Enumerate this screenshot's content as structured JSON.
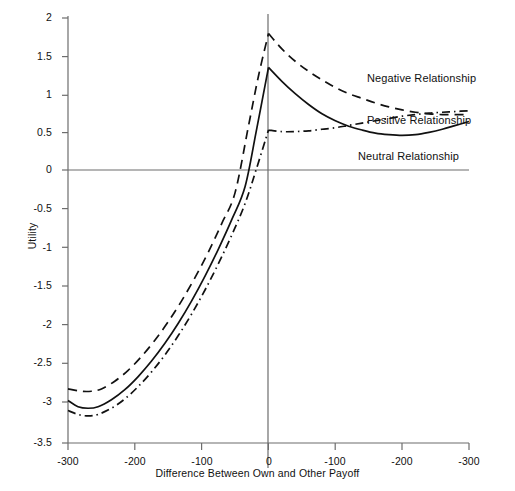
{
  "chart_data": {
    "type": "line",
    "title": "",
    "xlabel": "Difference Between Own and Other Payoff",
    "ylabel": "Utility",
    "xticks": [
      "-300",
      "-200",
      "-100",
      "0",
      "-100",
      "-200",
      "-300"
    ],
    "yticks": [
      "2",
      "1.5",
      "1",
      "0.5",
      "0",
      "-0.5",
      "-1",
      "-1.5",
      "-2",
      "-2.5",
      "-3",
      "-3.5"
    ],
    "ylim": [
      -3.5,
      2
    ],
    "xlim": [
      -300,
      300
    ],
    "grid": false,
    "legend_position": "inline-right",
    "zero_line": true,
    "center_vertical_line": true,
    "series": [
      {
        "name": "Negative Relationship",
        "style": "dashed",
        "color": "#111111",
        "x": [
          -300,
          -280,
          -265,
          -250,
          -230,
          -210,
          -190,
          -170,
          -150,
          -130,
          -110,
          -90,
          -70,
          -50,
          -30,
          -15,
          0,
          20,
          40,
          60,
          80,
          100,
          120,
          140,
          160,
          180,
          200,
          220,
          240,
          260,
          280,
          300
        ],
        "values": [
          -2.8,
          -2.83,
          -2.83,
          -2.8,
          -2.7,
          -2.56,
          -2.38,
          -2.17,
          -1.93,
          -1.66,
          -1.36,
          -1.03,
          -0.66,
          -0.26,
          0.6,
          1.25,
          1.8,
          1.6,
          1.44,
          1.31,
          1.2,
          1.1,
          1.02,
          0.96,
          0.9,
          0.85,
          0.81,
          0.78,
          0.76,
          0.75,
          0.75,
          0.75
        ]
      },
      {
        "name": "Neutral Relationship",
        "style": "solid",
        "color": "#111111",
        "x": [
          -300,
          -285,
          -270,
          -255,
          -235,
          -215,
          -195,
          -175,
          -155,
          -135,
          -115,
          -95,
          -75,
          -55,
          -35,
          -18,
          0,
          20,
          40,
          60,
          80,
          100,
          120,
          140,
          160,
          180,
          200,
          220,
          240,
          260,
          280,
          300
        ],
        "values": [
          -2.95,
          -3.03,
          -3.05,
          -3.03,
          -2.94,
          -2.81,
          -2.64,
          -2.44,
          -2.21,
          -1.95,
          -1.66,
          -1.34,
          -0.99,
          -0.61,
          -0.18,
          0.55,
          1.36,
          1.18,
          1.02,
          0.88,
          0.76,
          0.67,
          0.6,
          0.55,
          0.51,
          0.49,
          0.48,
          0.49,
          0.52,
          0.56,
          0.61,
          0.66
        ]
      },
      {
        "name": "Positive Relationship",
        "style": "dash-dot",
        "color": "#111111",
        "x": [
          -300,
          -285,
          -270,
          -255,
          -235,
          -215,
          -195,
          -175,
          -155,
          -135,
          -115,
          -95,
          -75,
          -55,
          -35,
          -18,
          0,
          20,
          40,
          60,
          80,
          100,
          120,
          140,
          160,
          180,
          200,
          220,
          240,
          260,
          280,
          300
        ],
        "values": [
          -3.08,
          -3.13,
          -3.15,
          -3.13,
          -3.05,
          -2.93,
          -2.77,
          -2.58,
          -2.36,
          -2.11,
          -1.83,
          -1.52,
          -1.18,
          -0.81,
          -0.4,
          0.05,
          0.55,
          0.53,
          0.53,
          0.54,
          0.56,
          0.58,
          0.61,
          0.64,
          0.67,
          0.7,
          0.73,
          0.75,
          0.77,
          0.78,
          0.79,
          0.8
        ]
      }
    ],
    "annotations": [
      {
        "id": "label-negative",
        "text": "Negative Relationship"
      },
      {
        "id": "label-positive",
        "text": "Positive Relationship"
      },
      {
        "id": "label-neutral",
        "text": "Neutral Relationship"
      }
    ],
    "colors": {
      "axis": "#6d6d6d",
      "curve": "#111111",
      "text": "#111111",
      "background": "#ffffff"
    }
  }
}
